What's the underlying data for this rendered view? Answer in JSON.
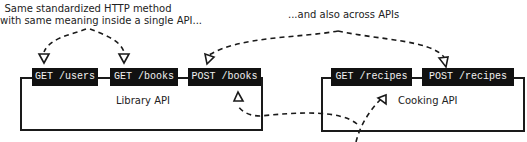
{
  "annotations": {
    "left_note_line1": "Same standardized HTTP method",
    "left_note_line2": "with same meaning  inside a single API...",
    "right_note": "...and also across APIs"
  },
  "apis": [
    {
      "name": "Library API",
      "endpoints": [
        {
          "label": "GET /users"
        },
        {
          "label": "GET /books"
        },
        {
          "label": "POST /books"
        }
      ]
    },
    {
      "name": "Cooking API",
      "endpoints": [
        {
          "label": "GET /recipes"
        },
        {
          "label": "POST /recipes"
        }
      ]
    }
  ],
  "colors": {
    "endpoint_bg": "#111111",
    "endpoint_text": "#f2f2f2",
    "line": "#1a1a1a"
  }
}
